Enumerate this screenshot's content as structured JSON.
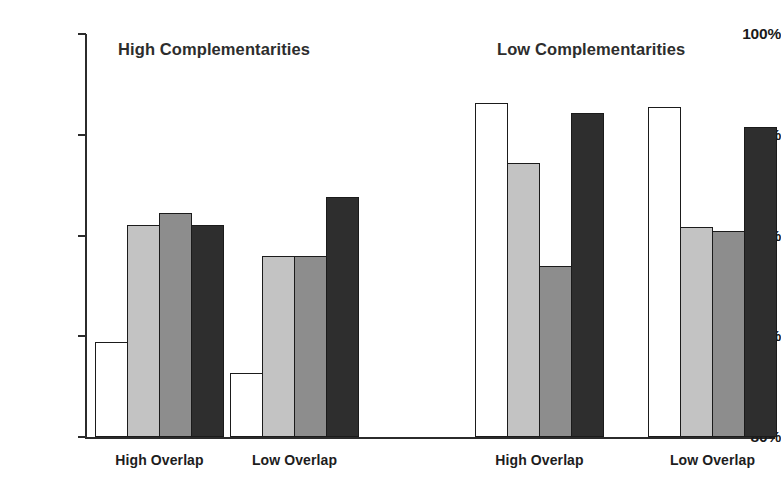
{
  "chart_data": {
    "type": "bar",
    "title": "",
    "subtitle": "",
    "xlabel": "",
    "ylabel": "",
    "ylim": [
      80,
      100
    ],
    "ytick_labels": [
      "100%",
      "95%",
      "90%",
      "85%",
      "80%"
    ],
    "ytick_values": [
      100,
      95,
      90,
      85,
      80
    ],
    "grid": false,
    "legend_position": "none",
    "panels": [
      {
        "title": "High Complementarities",
        "categories": [
          "High Overlap",
          "Low Overlap"
        ],
        "series": [
          {
            "name": "series-1",
            "color": "#ffffff",
            "values": [
              84.7,
              83.2
            ]
          },
          {
            "name": "series-2",
            "color": "#c3c3c3",
            "values": [
              90.5,
              89.0
            ]
          },
          {
            "name": "series-3",
            "color": "#8d8d8d",
            "values": [
              91.1,
              89.0
            ]
          },
          {
            "name": "series-4",
            "color": "#2e2e2e",
            "values": [
              90.5,
              91.9
            ]
          }
        ]
      },
      {
        "title": "Low Complementarities",
        "categories": [
          "High Overlap",
          "Low Overlap"
        ],
        "series": [
          {
            "name": "series-1",
            "color": "#ffffff",
            "values": [
              96.6,
              96.4
            ]
          },
          {
            "name": "series-2",
            "color": "#c3c3c3",
            "values": [
              93.6,
              90.4
            ]
          },
          {
            "name": "series-3",
            "color": "#8d8d8d",
            "values": [
              88.5,
              90.2
            ]
          },
          {
            "name": "series-4",
            "color": "#2e2e2e",
            "values": [
              96.1,
              95.4
            ]
          }
        ]
      }
    ]
  },
  "colors": {
    "axis": "#2b2b2b",
    "text": "#1a1a1a",
    "series_1": "#ffffff",
    "series_2": "#c3c3c3",
    "series_3": "#8d8d8d",
    "series_4": "#2e2e2e",
    "background": "#ffffff"
  },
  "layout": {
    "plot_left": 85,
    "plot_top": 34,
    "plot_bottom": 437,
    "plot_right": 775,
    "bar_width": 33,
    "panel_group_x": [
      [
        95,
        230
      ],
      [
        475,
        648
      ]
    ]
  }
}
